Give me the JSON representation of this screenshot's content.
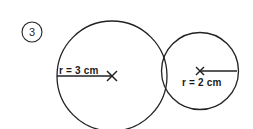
{
  "figure": {
    "background_color": "#ffffff",
    "stroke_color": "#222222",
    "text_color": "#1a1a1a",
    "item_number": {
      "label": "3",
      "style": "circled",
      "center_x": 32,
      "center_y": 32,
      "radius": 10
    },
    "circles": [
      {
        "name": "large-circle",
        "center_x": 112,
        "center_y": 76,
        "radius": 55,
        "radius_label": "r = 3 cm",
        "radius_value": 3,
        "radius_units": "cm",
        "label_position": "above-line",
        "center_marker": "x",
        "radius_line_from_x": 57,
        "radius_line_to_x": 112,
        "radius_line_y": 76,
        "label_x": 59,
        "label_y": 74,
        "cropped_at_bottom": true
      },
      {
        "name": "small-circle",
        "center_x": 200,
        "center_y": 71,
        "radius": 38.5,
        "radius_label": "r = 2 cm",
        "radius_value": 2,
        "radius_units": "cm",
        "label_position": "below-line",
        "center_marker": "x",
        "radius_line_from_x": 200,
        "radius_line_to_x": 237,
        "radius_line_y": 71,
        "label_x": 182,
        "label_y": 86,
        "cropped_at_bottom": false
      }
    ],
    "tangency": {
      "description": "externally tangent",
      "point_x": 163,
      "point_y": 74
    }
  }
}
